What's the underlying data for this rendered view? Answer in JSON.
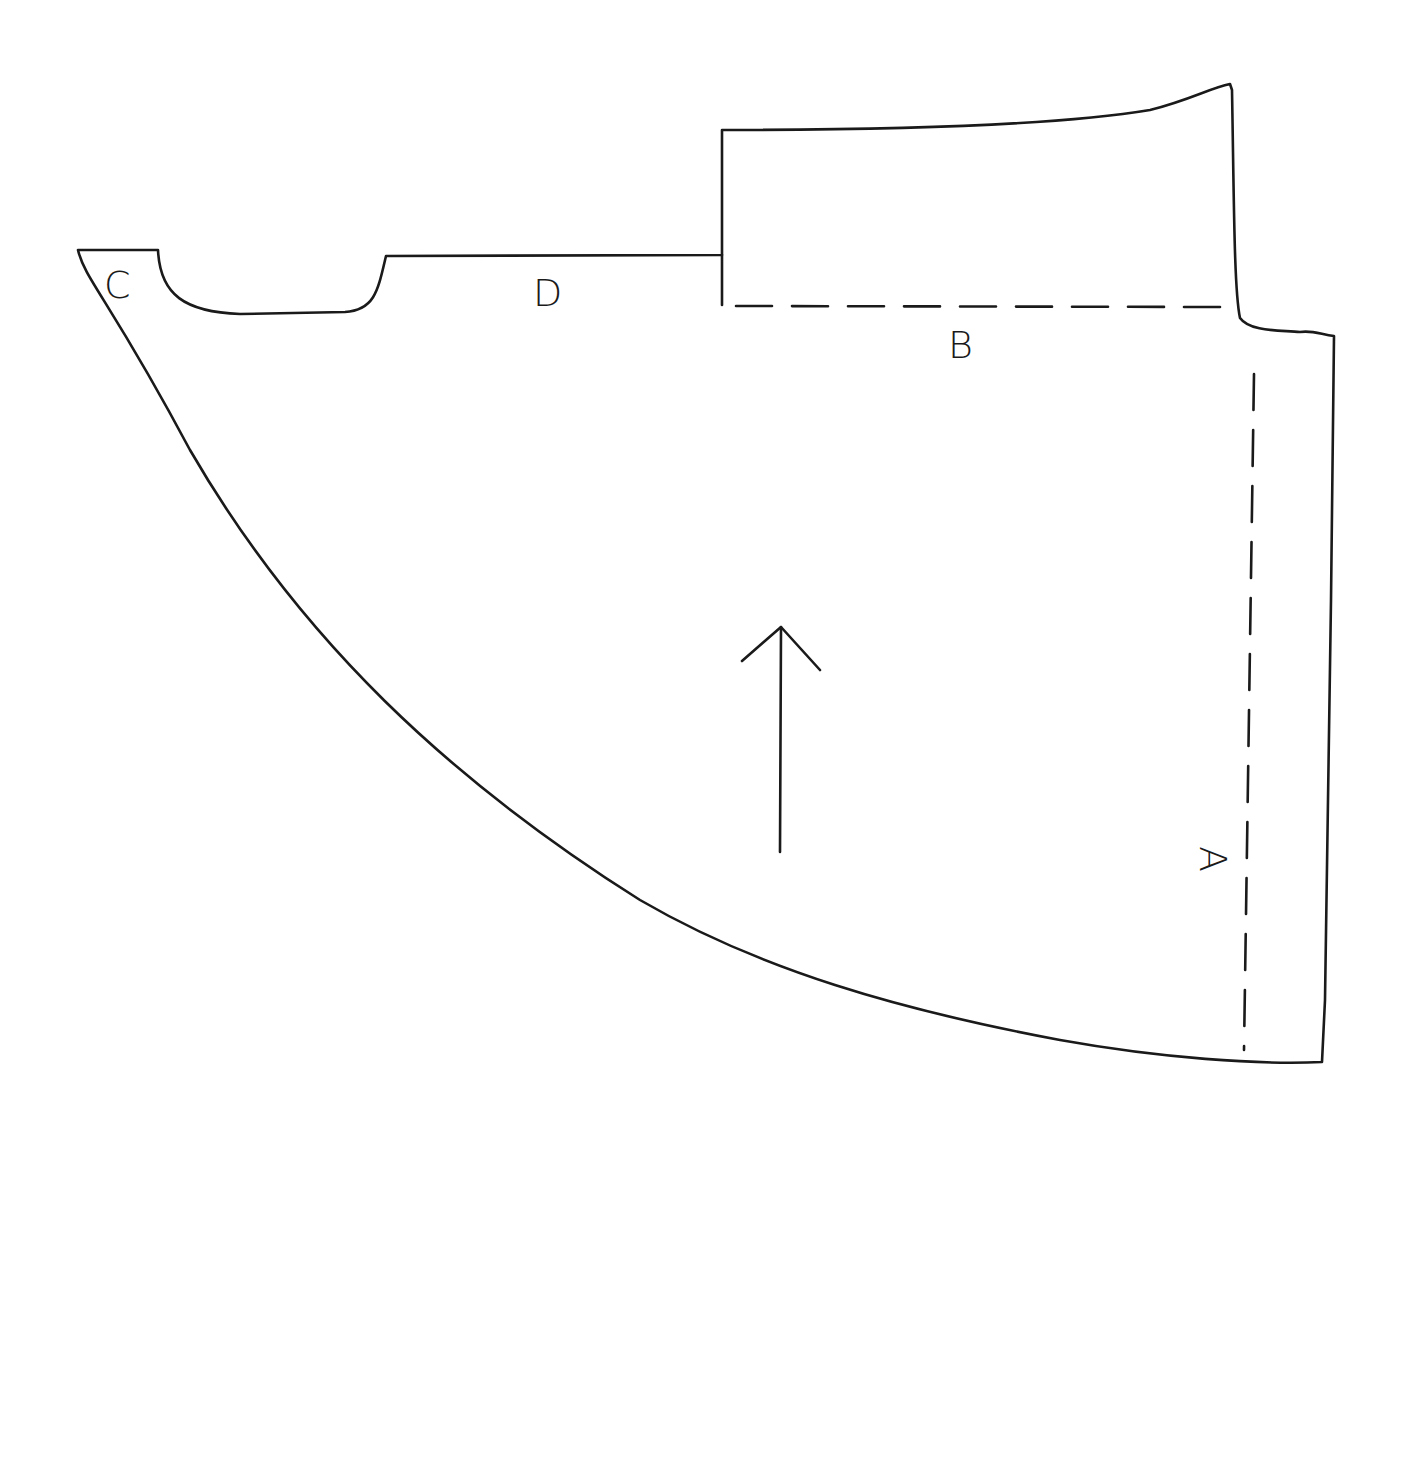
{
  "diagram": {
    "labels": {
      "c": "C",
      "d": "D",
      "b": "B",
      "a": "A"
    },
    "grainline": "grainline-arrow",
    "fold_lines": [
      "B",
      "A"
    ],
    "stroke_color": "#1a1a1a",
    "background": "#ffffff"
  }
}
